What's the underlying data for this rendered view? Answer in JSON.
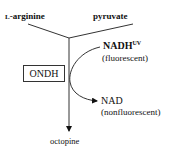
{
  "diagram": {
    "substrates": {
      "left": "L-arginine",
      "right": "pyruvate"
    },
    "enzyme": "ONDH",
    "cofactor_in": {
      "name": "NADH",
      "superscript": "UV",
      "note": "(fluorescent)"
    },
    "cofactor_out": {
      "name": "NAD",
      "note": "(nonfluorescent)"
    },
    "product": "octopine"
  }
}
